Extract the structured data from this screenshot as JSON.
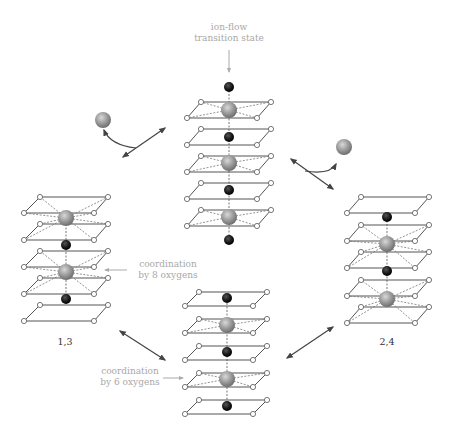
{
  "labels": {
    "transition_state_line1": "ion-flow",
    "transition_state_line2": "transition state",
    "coord8_line1": "coordination",
    "coord8_line2": "by 8 oxygens",
    "coord6_line1": "coordination",
    "coord6_line2": "by 6 oxygens",
    "left_stack": "1,3",
    "right_stack": "2,4"
  },
  "colors": {
    "frame_line": "#555555",
    "dashed_bond": "#777777",
    "gray_ion": "#9a9a9a",
    "black_ion": "#1a1a1a",
    "label_gray": "#a8a8a8",
    "arrow": "#444444"
  },
  "stacks": [
    {
      "id": "top-center",
      "description": "ion-flow transition state",
      "planes": 5,
      "gray_ions": 3,
      "black_ions": 4
    },
    {
      "id": "left",
      "description": "1,3",
      "planes": 5,
      "gray_ions": 2,
      "black_ions": 2
    },
    {
      "id": "right",
      "description": "2,4",
      "planes": 5,
      "gray_ions": 2,
      "black_ions": 2
    },
    {
      "id": "bottom-center",
      "description": "coordination by 6 oxygens",
      "planes": 5,
      "gray_ions": 2,
      "black_ions": 3
    }
  ]
}
